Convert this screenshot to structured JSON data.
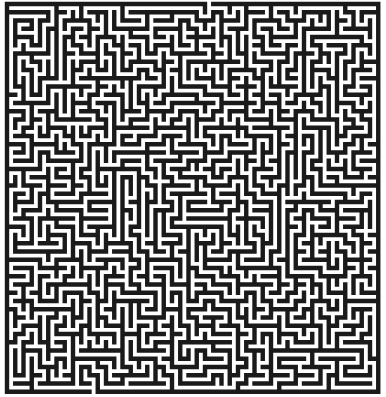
{
  "maze": {
    "cols": 45,
    "rows": 47,
    "cell_px": 8.25,
    "origin_x": 7,
    "origin_y": 4,
    "wall_px": 4.4,
    "wall_color": "#1a1a1a",
    "path_color": "#ffffff",
    "entrance": {
      "side": "top",
      "col": 24
    },
    "exit": {
      "side": "bottom",
      "col": 10
    },
    "seed": 20240611
  }
}
